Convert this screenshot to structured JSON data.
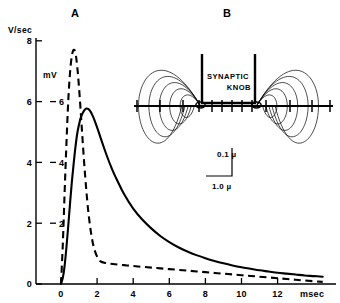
{
  "figure": {
    "panels": [
      {
        "id": "A",
        "label": "A"
      },
      {
        "id": "B",
        "label": "B"
      }
    ]
  },
  "chart_data": {
    "type": "line",
    "title": "",
    "xlabel": "msec",
    "ylabel": "V/sec",
    "secondary_ylabel": "mV",
    "xlim": [
      -0.9,
      14.6
    ],
    "ylim": [
      0,
      8.4
    ],
    "xticks": [
      0,
      2,
      4,
      6,
      8,
      10,
      12
    ],
    "xticklabels": [
      "0",
      "2",
      "4",
      "6",
      "8",
      "10",
      "12"
    ],
    "yticks": [
      0,
      2,
      4,
      6,
      8
    ],
    "yticklabels": [
      "0",
      "2",
      "4",
      "6",
      "8"
    ],
    "secondary_yticks": [
      2,
      4,
      6
    ],
    "secondary_yticklabels": [
      "2",
      "4",
      "6"
    ],
    "grid": false,
    "legend": "none",
    "series": [
      {
        "name": "rate of rise (V/sec)",
        "style": "dashed",
        "units": "V/sec",
        "x": [
          0.0,
          0.1,
          0.2,
          0.3,
          0.4,
          0.5,
          0.6,
          0.7,
          0.8,
          0.9,
          1.0,
          1.1,
          1.2,
          1.3,
          1.4,
          1.5,
          1.6,
          1.7,
          1.8,
          1.9,
          2.0,
          2.1,
          2.2,
          2.4,
          2.6,
          3.0,
          3.5,
          4.0,
          5.0,
          6.0,
          7.0,
          8.0,
          9.0,
          10.0,
          11.0,
          12.0,
          13.0,
          14.0,
          14.5
        ],
        "y": [
          0.0,
          1.3,
          3.0,
          4.6,
          6.0,
          6.95,
          7.5,
          7.7,
          7.6,
          7.15,
          6.45,
          5.6,
          4.7,
          3.85,
          3.1,
          2.45,
          1.95,
          1.55,
          1.25,
          1.05,
          0.9,
          0.8,
          0.74,
          0.7,
          0.68,
          0.65,
          0.62,
          0.59,
          0.54,
          0.49,
          0.44,
          0.39,
          0.34,
          0.29,
          0.24,
          0.19,
          0.14,
          0.09,
          0.07
        ]
      },
      {
        "name": "synaptic potential (mV)",
        "style": "solid",
        "units": "mV",
        "x": [
          0.0,
          0.1,
          0.2,
          0.3,
          0.4,
          0.5,
          0.6,
          0.7,
          0.8,
          0.9,
          1.0,
          1.1,
          1.2,
          1.3,
          1.4,
          1.5,
          1.6,
          1.7,
          1.8,
          2.0,
          2.2,
          2.4,
          2.6,
          2.8,
          3.0,
          3.5,
          4.0,
          4.5,
          5.0,
          5.5,
          6.0,
          6.5,
          7.0,
          7.5,
          8.0,
          8.5,
          9.0,
          9.5,
          10.0,
          10.5,
          11.0,
          11.5,
          12.0,
          12.5,
          13.0,
          13.5,
          14.0,
          14.5
        ],
        "y": [
          0.0,
          0.2,
          0.6,
          1.2,
          1.9,
          2.65,
          3.35,
          3.95,
          4.5,
          4.95,
          5.25,
          5.48,
          5.62,
          5.72,
          5.77,
          5.76,
          5.7,
          5.6,
          5.47,
          5.15,
          4.8,
          4.45,
          4.12,
          3.82,
          3.55,
          2.95,
          2.48,
          2.12,
          1.83,
          1.58,
          1.38,
          1.21,
          1.07,
          0.95,
          0.85,
          0.76,
          0.68,
          0.61,
          0.55,
          0.5,
          0.45,
          0.41,
          0.37,
          0.34,
          0.31,
          0.28,
          0.26,
          0.24
        ]
      }
    ]
  },
  "diagram": {
    "title": "B",
    "knob_label_line1": "SYNAPTIC",
    "knob_label_line2": "KNOB",
    "scale_vertical": "0.1 µ",
    "scale_horizontal": "1.0 µ",
    "field_line_count": 5,
    "membrane_tick_count": 11
  },
  "colors": {
    "ink": "#000000",
    "background": "#ffffff"
  }
}
